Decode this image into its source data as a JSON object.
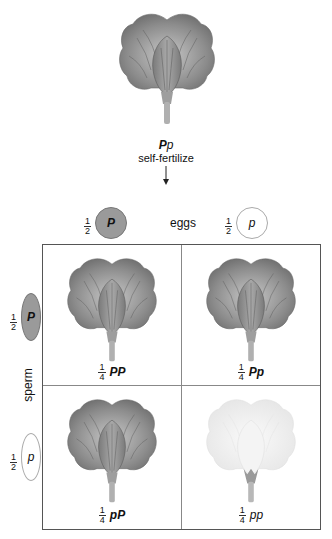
{
  "parent": {
    "genotype_main": "P",
    "genotype_second": "p",
    "phenotype": "purple",
    "action": "self-fertilize",
    "arrow": "down-arrow"
  },
  "eggs": {
    "label": "eggs",
    "gametes": [
      {
        "fraction_num": "1",
        "fraction_den": "2",
        "allele": "P",
        "type": "dominant"
      },
      {
        "fraction_num": "1",
        "fraction_den": "2",
        "allele": "p",
        "type": "recessive"
      }
    ]
  },
  "sperm": {
    "label": "sperm",
    "gametes": [
      {
        "fraction_num": "1",
        "fraction_den": "2",
        "allele": "P",
        "type": "dominant"
      },
      {
        "fraction_num": "1",
        "fraction_den": "2",
        "allele": "p",
        "type": "recessive"
      }
    ]
  },
  "grid": {
    "cells": [
      {
        "fraction_num": "1",
        "fraction_den": "4",
        "genotype": "PP",
        "phenotype": "purple"
      },
      {
        "fraction_num": "1",
        "fraction_den": "4",
        "genotype": "Pp",
        "phenotype": "purple"
      },
      {
        "fraction_num": "1",
        "fraction_den": "4",
        "genotype": "pP",
        "phenotype": "purple"
      },
      {
        "fraction_num": "1",
        "fraction_den": "4",
        "genotype": "pp",
        "phenotype": "white"
      }
    ]
  },
  "colors": {
    "dominant_flower": "#8f8f8f",
    "recessive_flower": "#f2f2f2",
    "dominant_gamete": "#9a9a9a",
    "grid_border": "#555555"
  }
}
